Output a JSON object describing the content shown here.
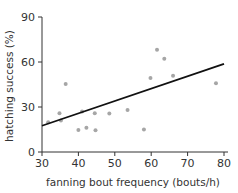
{
  "chart_data": {
    "type": "scatter",
    "title": "",
    "xlabel": "fanning bout frequency (bouts/h)",
    "ylabel": "hatching success (%)",
    "xlim": [
      30,
      80
    ],
    "ylim": [
      0,
      90
    ],
    "xticks": [
      30,
      40,
      50,
      60,
      70,
      80
    ],
    "yticks": [
      0,
      30,
      60,
      90
    ],
    "grid": false,
    "legend": null,
    "series": [
      {
        "name": "observations",
        "color": "#a6a6a6",
        "points": [
          {
            "x": 31.7,
            "y": 19.8
          },
          {
            "x": 34.8,
            "y": 25.8
          },
          {
            "x": 35.2,
            "y": 21.0
          },
          {
            "x": 36.5,
            "y": 45.3
          },
          {
            "x": 40.0,
            "y": 14.7
          },
          {
            "x": 41.0,
            "y": 27.0
          },
          {
            "x": 42.2,
            "y": 16.2
          },
          {
            "x": 44.5,
            "y": 25.8
          },
          {
            "x": 44.7,
            "y": 14.5
          },
          {
            "x": 48.5,
            "y": 25.6
          },
          {
            "x": 53.5,
            "y": 28.0
          },
          {
            "x": 58.0,
            "y": 15.0
          },
          {
            "x": 59.8,
            "y": 49.3
          },
          {
            "x": 61.6,
            "y": 68.2
          },
          {
            "x": 63.6,
            "y": 62.2
          },
          {
            "x": 66.0,
            "y": 50.9
          },
          {
            "x": 77.8,
            "y": 45.8
          }
        ]
      }
    ],
    "trendline": {
      "name": "linear fit",
      "color": "#111111",
      "x": [
        30,
        80
      ],
      "y": [
        17.5,
        58.7
      ]
    }
  }
}
